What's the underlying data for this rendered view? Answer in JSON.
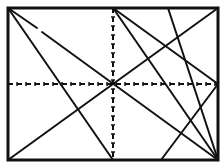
{
  "diagram": {
    "title": "",
    "stroke_color": "#111111",
    "background": "#ffffff",
    "frame": {
      "x1": 8,
      "y1": 8,
      "x2": 218,
      "y2": 160,
      "stroke_width": 3
    },
    "dashed_axes": [
      {
        "name": "vertical-midline",
        "x1": 113,
        "y1": 8,
        "x2": 113,
        "y2": 160
      },
      {
        "name": "horizontal-midline",
        "x1": 8,
        "y1": 84,
        "x2": 218,
        "y2": 84
      }
    ],
    "solid_lines": [
      {
        "name": "line-topleft-to-bottommid",
        "x1": 8,
        "y1": 8,
        "x2": 113,
        "y2": 160
      },
      {
        "name": "line-topleft-to-bottomright-a",
        "x1": 8,
        "y1": 8,
        "x2": 37,
        "y2": 28
      },
      {
        "name": "line-topleft-to-bottomright-b",
        "x1": 42,
        "y1": 32,
        "x2": 218,
        "y2": 160
      },
      {
        "name": "line-bottomleft-to-topright",
        "x1": 8,
        "y1": 160,
        "x2": 218,
        "y2": 8
      },
      {
        "name": "line-topmid-to-rightmid",
        "x1": 113,
        "y1": 8,
        "x2": 218,
        "y2": 84
      },
      {
        "name": "line-topmid-to-bottomright",
        "x1": 113,
        "y1": 8,
        "x2": 218,
        "y2": 160
      },
      {
        "name": "line-top-to-bottomright",
        "x1": 168,
        "y1": 8,
        "x2": 218,
        "y2": 160
      },
      {
        "name": "line-rightmid-to-bottom",
        "x1": 218,
        "y1": 84,
        "x2": 161,
        "y2": 160
      }
    ]
  }
}
